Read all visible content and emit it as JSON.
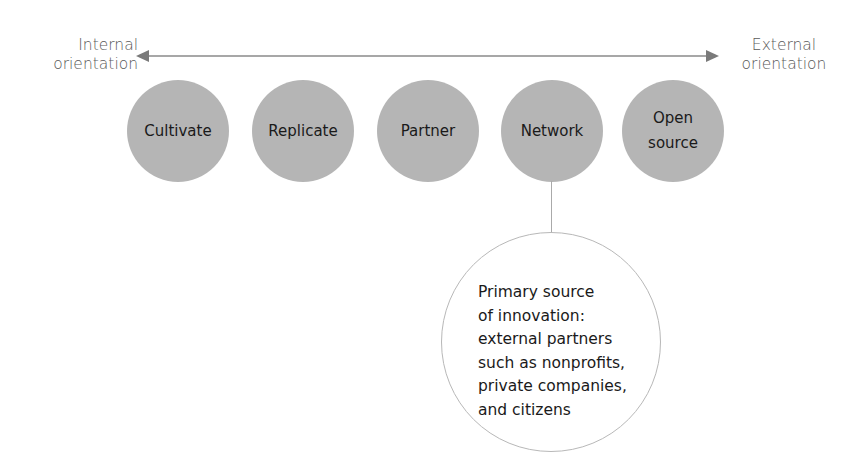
{
  "axis": {
    "left_label_line1": "Internal",
    "left_label_line2": "orientation",
    "right_label_line1": "External",
    "right_label_line2": "orientation",
    "color": "#8a8a8a"
  },
  "stages": [
    {
      "label": "Cultivate"
    },
    {
      "label": "Replicate"
    },
    {
      "label": "Partner"
    },
    {
      "label": "Network"
    },
    {
      "label_line1": "Open",
      "label_line2": "source"
    }
  ],
  "stage_color": "#b5b5b5",
  "detail": {
    "attached_to": "Network",
    "lines": [
      "Primary source",
      "of innovation:",
      "external partners",
      "such as nonprofits,",
      "private companies,",
      "and citizens"
    ]
  }
}
